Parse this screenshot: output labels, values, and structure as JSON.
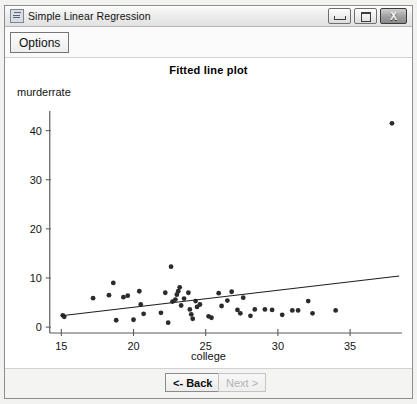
{
  "window": {
    "title": "Simple Linear Regression",
    "icon": "app-icon",
    "buttons": {
      "minimize": "minimize-icon",
      "maximize": "maximize-icon",
      "close": "X"
    }
  },
  "toolbar": {
    "options_label": "Options"
  },
  "footer": {
    "back_label": "<- Back",
    "next_label": "Next >"
  },
  "chart_data": {
    "type": "scatter",
    "title": "Fitted line plot",
    "xlabel": "college",
    "ylabel": "murderrate",
    "xlim": [
      14.2,
      38.6
    ],
    "ylim": [
      -1.2,
      44
    ],
    "xticks": [
      15,
      20,
      25,
      30,
      35
    ],
    "yticks": [
      0,
      10,
      20,
      30,
      40
    ],
    "grid": false,
    "legend": "none",
    "fit_line": {
      "label": "fitted regression line",
      "x_start": 15.0,
      "y_start": 2.3,
      "x_end": 38.4,
      "y_end": 10.4
    },
    "points": [
      [
        15.1,
        2.4
      ],
      [
        15.2,
        2.1
      ],
      [
        17.2,
        5.9
      ],
      [
        18.3,
        6.5
      ],
      [
        18.6,
        9.0
      ],
      [
        18.8,
        1.4
      ],
      [
        19.3,
        6.1
      ],
      [
        19.6,
        6.4
      ],
      [
        20.0,
        1.5
      ],
      [
        20.4,
        7.3
      ],
      [
        20.5,
        4.6
      ],
      [
        20.7,
        2.7
      ],
      [
        21.9,
        2.9
      ],
      [
        22.2,
        7.0
      ],
      [
        22.4,
        0.9
      ],
      [
        22.6,
        12.3
      ],
      [
        22.7,
        5.2
      ],
      [
        22.9,
        5.6
      ],
      [
        23.0,
        6.6
      ],
      [
        23.1,
        7.3
      ],
      [
        23.2,
        8.1
      ],
      [
        23.3,
        4.4
      ],
      [
        23.5,
        5.8
      ],
      [
        23.8,
        7.0
      ],
      [
        23.9,
        3.6
      ],
      [
        24.0,
        2.6
      ],
      [
        24.1,
        1.7
      ],
      [
        24.3,
        5.3
      ],
      [
        24.4,
        4.1
      ],
      [
        24.6,
        4.6
      ],
      [
        25.2,
        2.2
      ],
      [
        25.4,
        1.9
      ],
      [
        25.9,
        6.9
      ],
      [
        26.1,
        4.3
      ],
      [
        26.5,
        5.4
      ],
      [
        26.8,
        7.2
      ],
      [
        27.2,
        3.5
      ],
      [
        27.4,
        2.8
      ],
      [
        27.6,
        6.0
      ],
      [
        28.1,
        2.3
      ],
      [
        28.4,
        3.6
      ],
      [
        29.1,
        3.6
      ],
      [
        29.6,
        3.5
      ],
      [
        30.3,
        2.5
      ],
      [
        31.0,
        3.4
      ],
      [
        31.4,
        3.4
      ],
      [
        32.1,
        5.3
      ],
      [
        32.4,
        2.8
      ],
      [
        34.0,
        3.4
      ],
      [
        37.9,
        41.5
      ]
    ]
  }
}
